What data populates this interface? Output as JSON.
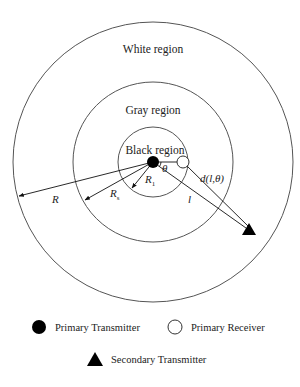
{
  "diagram": {
    "regions": {
      "white": "White region",
      "gray": "Gray region",
      "black": "Black region"
    },
    "labels": {
      "R": "R",
      "Rs_base": "R",
      "Rs_sub": "s",
      "R1_base": "R",
      "R1_sub": "1",
      "theta": "θ",
      "l": "l",
      "distance": "d(l,θ)"
    },
    "geometry": {
      "center": [
        153,
        162
      ],
      "outer_radius": 140,
      "gray_radius": 80,
      "black_radius": 35,
      "receiver": [
        183,
        162
      ],
      "secondary_transmitter": [
        249,
        230
      ]
    },
    "colors": {
      "stroke": "#555555",
      "fill_marker": "#000000",
      "background": "#ffffff"
    }
  },
  "legend": {
    "items": [
      {
        "symbol": "filled-circle",
        "label": "Primary Transmitter"
      },
      {
        "symbol": "hollow-circle",
        "label": "Primary Receiver"
      },
      {
        "symbol": "filled-triangle",
        "label": "Secondary Transmitter"
      }
    ]
  }
}
